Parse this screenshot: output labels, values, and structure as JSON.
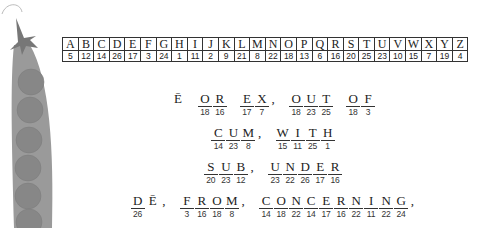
{
  "cipher_key": [
    {
      "letter": "A",
      "number": "5"
    },
    {
      "letter": "B",
      "number": "12"
    },
    {
      "letter": "C",
      "number": "14"
    },
    {
      "letter": "D",
      "number": "26"
    },
    {
      "letter": "E",
      "number": "17"
    },
    {
      "letter": "F",
      "number": "3"
    },
    {
      "letter": "G",
      "number": "24"
    },
    {
      "letter": "H",
      "number": "1"
    },
    {
      "letter": "I",
      "number": "11"
    },
    {
      "letter": "J",
      "number": "2"
    },
    {
      "letter": "K",
      "number": "9"
    },
    {
      "letter": "L",
      "number": "21"
    },
    {
      "letter": "M",
      "number": "8"
    },
    {
      "letter": "N",
      "number": "22"
    },
    {
      "letter": "O",
      "number": "18"
    },
    {
      "letter": "P",
      "number": "13"
    },
    {
      "letter": "Q",
      "number": "6"
    },
    {
      "letter": "R",
      "number": "16"
    },
    {
      "letter": "S",
      "number": "20"
    },
    {
      "letter": "T",
      "number": "25"
    },
    {
      "letter": "U",
      "number": "23"
    },
    {
      "letter": "V",
      "number": "10"
    },
    {
      "letter": "W",
      "number": "15"
    },
    {
      "letter": "X",
      "number": "7"
    },
    {
      "letter": "Y",
      "number": "19"
    },
    {
      "letter": "Z",
      "number": "4"
    }
  ],
  "lines": [
    [
      {
        "cells": [
          {
            "letter": "Ē",
            "number": "",
            "plain": true
          }
        ]
      },
      {
        "cells": [
          {
            "letter": "O",
            "number": "18"
          },
          {
            "letter": "R",
            "number": "16"
          }
        ]
      },
      {
        "cells": [
          {
            "letter": "E",
            "number": "17"
          },
          {
            "letter": "X",
            "number": "7"
          }
        ],
        "comma": ","
      },
      {
        "cells": [
          {
            "letter": "O",
            "number": "18"
          },
          {
            "letter": "U",
            "number": "23"
          },
          {
            "letter": "T",
            "number": "25"
          }
        ]
      },
      {
        "cells": [
          {
            "letter": "O",
            "number": "18"
          },
          {
            "letter": "F",
            "number": "3"
          }
        ]
      }
    ],
    [
      {
        "cells": [
          {
            "letter": "C",
            "number": "14"
          },
          {
            "letter": "U",
            "number": "23"
          },
          {
            "letter": "M",
            "number": "8"
          }
        ],
        "comma": ","
      },
      {
        "cells": [
          {
            "letter": "W",
            "number": "15"
          },
          {
            "letter": "I",
            "number": "11"
          },
          {
            "letter": "T",
            "number": "25"
          },
          {
            "letter": "H",
            "number": "1"
          }
        ]
      }
    ],
    [
      {
        "cells": [
          {
            "letter": "S",
            "number": "20"
          },
          {
            "letter": "U",
            "number": "23"
          },
          {
            "letter": "B",
            "number": "12"
          }
        ],
        "comma": ","
      },
      {
        "cells": [
          {
            "letter": "U",
            "number": "23"
          },
          {
            "letter": "N",
            "number": "22"
          },
          {
            "letter": "D",
            "number": "26"
          },
          {
            "letter": "E",
            "number": "17"
          },
          {
            "letter": "R",
            "number": "16"
          }
        ]
      }
    ],
    [
      {
        "cells": [
          {
            "letter": "D",
            "number": "26"
          },
          {
            "letter": "Ē",
            "number": "",
            "plain": true
          }
        ],
        "comma": ","
      },
      {
        "cells": [
          {
            "letter": "F",
            "number": "3"
          },
          {
            "letter": "R",
            "number": "16"
          },
          {
            "letter": "O",
            "number": "18"
          },
          {
            "letter": "M",
            "number": "8"
          }
        ],
        "comma": ","
      },
      {
        "cells": [
          {
            "letter": "C",
            "number": "14"
          },
          {
            "letter": "O",
            "number": "18"
          },
          {
            "letter": "N",
            "number": "22"
          },
          {
            "letter": "C",
            "number": "14"
          },
          {
            "letter": "E",
            "number": "17"
          },
          {
            "letter": "R",
            "number": "16"
          },
          {
            "letter": "N",
            "number": "22"
          },
          {
            "letter": "I",
            "number": "11"
          },
          {
            "letter": "N",
            "number": "22"
          },
          {
            "letter": "G",
            "number": "24"
          }
        ],
        "comma": ","
      }
    ]
  ]
}
